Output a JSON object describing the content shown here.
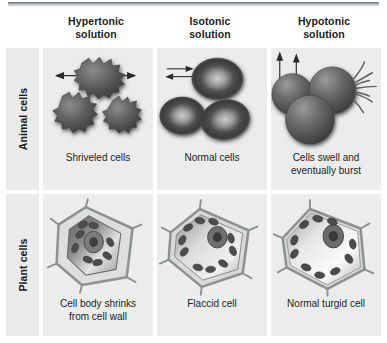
{
  "figure": {
    "corner_label": ""
  },
  "columns": [
    {
      "line1": "Hypertonic",
      "line2": "solution"
    },
    {
      "line1": "Isotonic",
      "line2": "solution"
    },
    {
      "line1": "Hypotonic",
      "line2": "solution"
    }
  ],
  "rows": [
    {
      "label": "Animal cells",
      "cells": [
        {
          "caption_line1": "Shriveled cells",
          "caption_line2": "",
          "art": "animal-hypertonic",
          "water_direction": "out",
          "cell_count": 3
        },
        {
          "caption_line1": "Normal cells",
          "caption_line2": "",
          "art": "animal-isotonic",
          "water_direction": "balanced",
          "cell_count": 3
        },
        {
          "caption_line1": "Cells swell and",
          "caption_line2": "eventually burst",
          "art": "animal-hypotonic",
          "water_direction": "in",
          "cell_count": 3
        }
      ]
    },
    {
      "label": "Plant cells",
      "cells": [
        {
          "caption_line1": "Cell body shrinks",
          "caption_line2": "from cell wall",
          "art": "plant-hypertonic",
          "water_direction": "out",
          "cell_count": 1
        },
        {
          "caption_line1": "Flaccid cell",
          "caption_line2": "",
          "art": "plant-isotonic",
          "water_direction": "balanced",
          "cell_count": 1
        },
        {
          "caption_line1": "Normal turgid cell",
          "caption_line2": "",
          "art": "plant-hypotonic",
          "water_direction": "in",
          "cell_count": 1
        }
      ]
    }
  ],
  "colors": {
    "panel_background": "#ececec",
    "label_background": "#ebebeb",
    "page_background": "#ffffff",
    "text": "#1c1c1c",
    "cell_dark": "#4a4a4a",
    "cell_mid": "#6e6e6e",
    "cell_light": "#d8d8d8",
    "wall": "#8d9192",
    "arrow": "#2b2b2b"
  }
}
